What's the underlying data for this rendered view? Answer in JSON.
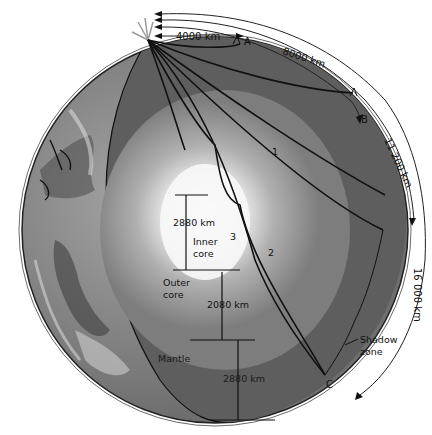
{
  "diagram": {
    "arc_distances": [
      {
        "id": "d1",
        "label": "4000 km",
        "station": "A"
      },
      {
        "id": "d2",
        "label": "8000 km",
        "station": "B"
      },
      {
        "id": "d3",
        "label": "11 200 km"
      },
      {
        "id": "d4",
        "label": "16 000 km"
      }
    ],
    "stations": {
      "a": "A",
      "b": "B",
      "c": "C"
    },
    "ray_labels": {
      "r1": "1",
      "r2": "2",
      "r3": "3"
    },
    "layers": {
      "inner_core": {
        "line1": "Inner",
        "line2": "core",
        "thickness": "2880 km"
      },
      "outer_core": {
        "line1": "Outer",
        "line2": "core",
        "thickness": "2080 km"
      },
      "mantle": {
        "label": "Mantle",
        "thickness": "2880 km"
      }
    },
    "shadow_zone": {
      "line1": "Shadow",
      "line2": "zone"
    },
    "colors": {
      "surface": "#8a8a8a",
      "mantle": "#5f5f5f",
      "outer_core": "#9a9a9a",
      "inner_core": "#f4f4f4",
      "line": "#111111"
    }
  }
}
